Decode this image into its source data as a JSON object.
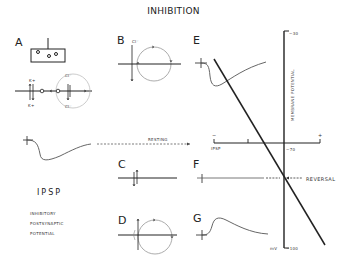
{
  "title": "INHIBITION",
  "panels": {
    "A": "A",
    "B": "B",
    "C": "C",
    "D": "D",
    "E": "E",
    "F": "F",
    "G": "G"
  },
  "ions": {
    "k_plus_top": "K+",
    "k_plus_bottom": "K+",
    "cl_minus_a_top": "Cl⁻",
    "cl_minus_a_bottom": "Cl⁻",
    "cl_minus_b": "Cl⁻"
  },
  "labels": {
    "resting": "RESTING",
    "reversal": "REVERSAL",
    "ipsp_big": "IPSP",
    "ipsp_desc": [
      "INHIBITORY",
      "POSTSYNAPTIC",
      "POTENTIAL"
    ]
  },
  "axis": {
    "vertical_label": "MEMBRANE POTENTIAL",
    "top_tick": "−30",
    "resting_tick": "−70",
    "bottom_tick": "−100",
    "unit": "mV",
    "horizontal_left_sign": "−",
    "horizontal_right_sign": "+",
    "horizontal_label": "IPSP"
  },
  "colors": {
    "ink": "#222222",
    "trace": "#666666",
    "light": "#999999"
  }
}
